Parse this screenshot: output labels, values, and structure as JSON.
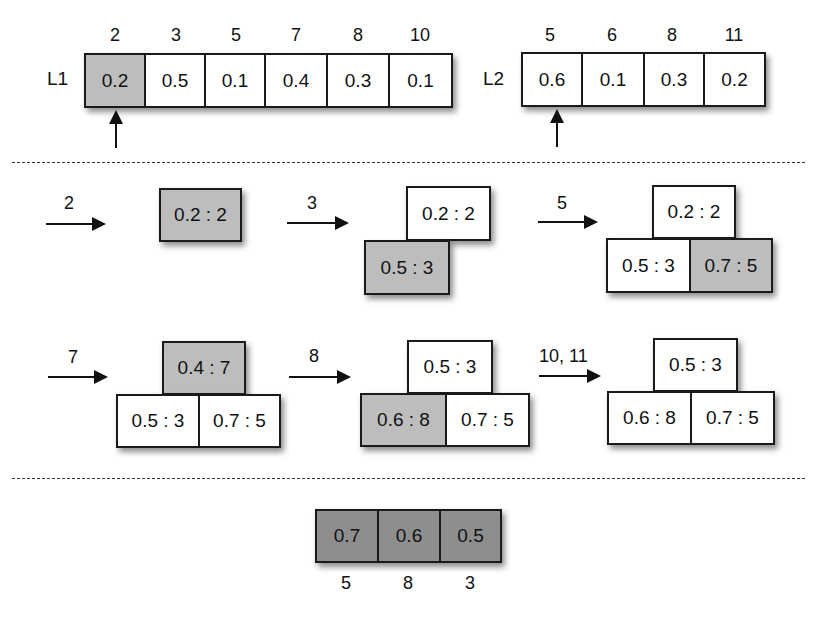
{
  "lists": {
    "l1": {
      "label": "L1",
      "indices": [
        "2",
        "3",
        "5",
        "7",
        "8",
        "10"
      ],
      "values": [
        "0.2",
        "0.5",
        "0.1",
        "0.4",
        "0.3",
        "0.1"
      ],
      "pointer_at": 0
    },
    "l2": {
      "label": "L2",
      "indices": [
        "5",
        "6",
        "8",
        "11"
      ],
      "values": [
        "0.6",
        "0.1",
        "0.3",
        "0.2"
      ],
      "pointer_at": 0
    }
  },
  "steps": [
    {
      "arrow_label": "2",
      "heap": {
        "top": "0.2 : 2",
        "bottom": []
      },
      "highlight": "top"
    },
    {
      "arrow_label": "3",
      "heap": {
        "top": "0.2 : 2",
        "bottom": [
          "0.5 : 3"
        ]
      },
      "highlight": "bottom0"
    },
    {
      "arrow_label": "5",
      "heap": {
        "top": "0.2 : 2",
        "bottom": [
          "0.5 : 3",
          "0.7 : 5"
        ]
      },
      "highlight": "bottom1"
    },
    {
      "arrow_label": "7",
      "heap": {
        "top": "0.4 : 7",
        "bottom": [
          "0.5 : 3",
          "0.7 : 5"
        ]
      },
      "highlight": "top"
    },
    {
      "arrow_label": "8",
      "heap": {
        "top": "0.5 : 3",
        "bottom": [
          "0.6 : 8",
          "0.7 : 5"
        ]
      },
      "highlight": "bottom0"
    },
    {
      "arrow_label": "10, 11",
      "heap": {
        "top": "0.5 : 3",
        "bottom": [
          "0.6 : 8",
          "0.7 : 5"
        ]
      },
      "highlight": "none"
    }
  ],
  "result": {
    "values": [
      "0.7",
      "0.6",
      "0.5"
    ],
    "indices": [
      "5",
      "8",
      "3"
    ]
  },
  "colors": {
    "highlight_gray": "#bdbdbd",
    "result_gray": "#8e8e8e",
    "border": "#1a1a1a",
    "background": "#ffffff"
  }
}
